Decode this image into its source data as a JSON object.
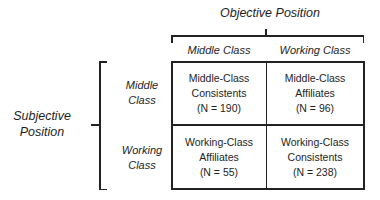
{
  "diagram": {
    "top_axis_title": "Objective Position",
    "left_axis_title_line1": "Subjective",
    "left_axis_title_line2": "Position",
    "columns": [
      "Middle Class",
      "Working Class"
    ],
    "rows": [
      {
        "line1": "Middle",
        "line2": "Class"
      },
      {
        "line1": "Working",
        "line2": "Class"
      }
    ],
    "cells": [
      [
        {
          "line1": "Middle-Class",
          "line2": "Consistents",
          "n": "(N = 190)"
        },
        {
          "line1": "Middle-Class",
          "line2": "Affiliates",
          "n": "(N = 96)"
        }
      ],
      [
        {
          "line1": "Working-Class",
          "line2": "Affiliates",
          "n": "(N = 55)"
        },
        {
          "line1": "Working-Class",
          "line2": "Consistents",
          "n": "(N = 238)"
        }
      ]
    ]
  }
}
